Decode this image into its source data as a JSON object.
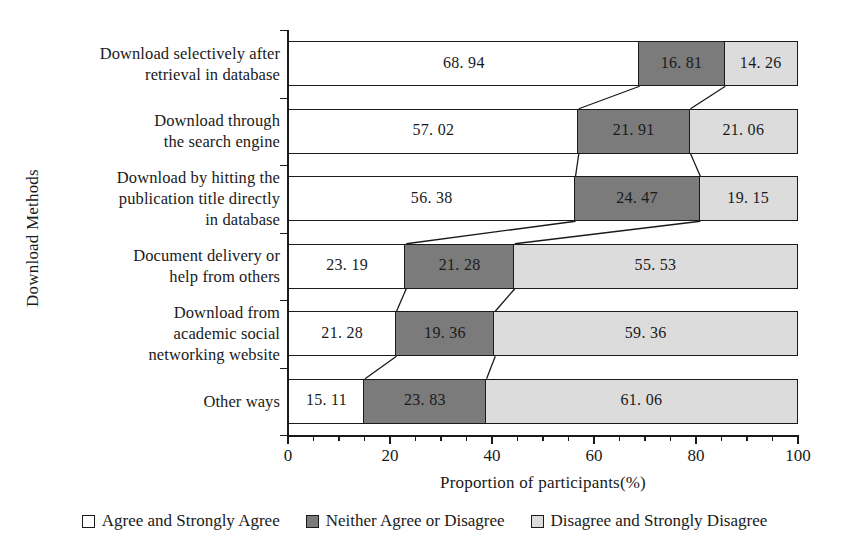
{
  "chart_data": {
    "type": "bar",
    "orientation": "horizontal",
    "stacked": true,
    "stack_mode": "percent",
    "title": "",
    "xlabel": "Proportion of participants(%)",
    "ylabel": "Download Methods",
    "xlim": [
      0,
      100
    ],
    "xticks": [
      0,
      20,
      40,
      60,
      80,
      100
    ],
    "xticklabels": [
      "0",
      "20",
      "40",
      "60",
      "80",
      "100"
    ],
    "minor_tick_interval": 5,
    "grid": false,
    "legend_position": "bottom",
    "categories": [
      "Download selectively after\nretrieval in database",
      "Download through\nthe search engine",
      "Download by hitting the\npublication title directly\nin database",
      "Document delivery or\nhelp from others",
      "Download from\nacademic social\nnetworking website",
      "Other ways"
    ],
    "category_lines": [
      [
        "Download selectively after",
        "retrieval in database"
      ],
      [
        "Download through",
        "the search engine"
      ],
      [
        "Download by hitting the",
        "publication title directly",
        "in database"
      ],
      [
        "Document delivery or",
        "help from others"
      ],
      [
        "Download from",
        "academic social",
        "networking website"
      ],
      [
        "Other ways"
      ]
    ],
    "series": [
      {
        "name": "Agree and Strongly Agree",
        "color": "#ffffff",
        "values": [
          68.94,
          57.02,
          56.38,
          23.19,
          21.28,
          15.11
        ],
        "labels": [
          "68. 94",
          "57. 02",
          "56. 38",
          "23. 19",
          "21. 28",
          "15. 11"
        ]
      },
      {
        "name": "Neither Agree or Disagree",
        "color": "#7b7b7b",
        "values": [
          16.81,
          21.91,
          24.47,
          21.28,
          19.36,
          23.83
        ],
        "labels": [
          "16. 81",
          "21. 91",
          "24. 47",
          "21. 28",
          "19. 36",
          "23. 83"
        ]
      },
      {
        "name": "Disagree and Strongly Disagree",
        "color": "#dcdcdc",
        "values": [
          14.26,
          21.06,
          19.15,
          55.53,
          59.36,
          61.06
        ],
        "labels": [
          "14. 26",
          "21. 06",
          "19. 15",
          "55. 53",
          "59. 36",
          "61. 06"
        ]
      }
    ]
  },
  "legend": {
    "items": [
      {
        "label": "Agree and Strongly Agree",
        "swatch": "white-square-icon"
      },
      {
        "label": "Neither Agree or Disagree",
        "swatch": "dark-gray-square-icon"
      },
      {
        "label": "Disagree and Strongly Disagree",
        "swatch": "light-gray-square-icon"
      }
    ]
  }
}
